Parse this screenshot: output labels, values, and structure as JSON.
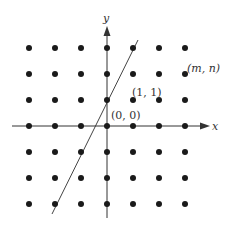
{
  "diagram": {
    "type": "integer-lattice-with-line",
    "grid": {
      "columns": [
        -3,
        -2,
        -1,
        0,
        1,
        2,
        3
      ],
      "rows": [
        3,
        2,
        1,
        0,
        -1,
        -2,
        -3
      ]
    },
    "axes": {
      "x_label": "x",
      "y_label": "y"
    },
    "labels": {
      "origin": "(0, 0)",
      "point_one_one": "(1, 1)",
      "point_mn": "(m, n)"
    },
    "line": {
      "description": "line through (0,1) with slope 2",
      "passes_through": [
        [
          0,
          1
        ],
        [
          -1,
          -1
        ],
        [
          1,
          3
        ],
        [
          -2,
          -3
        ]
      ]
    },
    "colors": {
      "dot": "#1a1a1a",
      "axis": "#333333",
      "line": "#444444",
      "label": "#333333"
    }
  }
}
